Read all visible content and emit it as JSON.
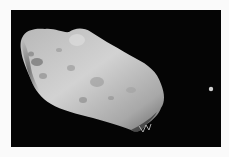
{
  "image": {
    "subject": "Asteroid with small moon against black space",
    "alt": "Grey cratered elongated asteroid and a tiny moon on a black background",
    "colors": {
      "background": "#fafafa",
      "space": "#050505",
      "asteroid_light": "#c8c8c8",
      "asteroid_mid": "#9a9a9a",
      "asteroid_dark": "#4a4a4a",
      "moon": "#d0d0d0"
    }
  }
}
